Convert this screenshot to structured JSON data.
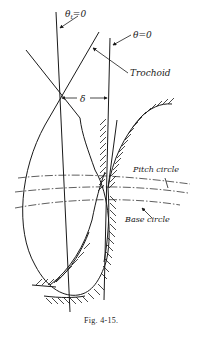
{
  "figure": {
    "caption": "Fig. 4-15.",
    "labels": {
      "theta_t": "θ",
      "theta_t_sub": "t",
      "theta_t_eq": "=0",
      "theta": "θ=0",
      "trochoid": "Trochoid",
      "delta": "δ",
      "pitch_circle": "Pitch circle",
      "base_circle": "Base circle"
    },
    "colors": {
      "ink": "#1a1a1a",
      "background": "#ffffff"
    }
  }
}
